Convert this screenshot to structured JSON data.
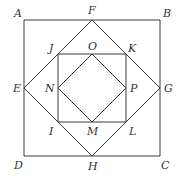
{
  "diagram": {
    "type": "nested-squares",
    "stroke_color": "#3a3a3a",
    "label_color": "#333333",
    "points": {
      "A": {
        "x": 24,
        "y": 20,
        "label": "A",
        "lx": 14,
        "ly": 17
      },
      "B": {
        "x": 160,
        "y": 20,
        "label": "B",
        "lx": 163,
        "ly": 17
      },
      "C": {
        "x": 160,
        "y": 156,
        "label": "C",
        "lx": 161,
        "ly": 169
      },
      "D": {
        "x": 24,
        "y": 156,
        "label": "D",
        "lx": 14,
        "ly": 169
      },
      "F": {
        "x": 92,
        "y": 20,
        "label": "F",
        "lx": 88,
        "ly": 14
      },
      "G": {
        "x": 160,
        "y": 88,
        "label": "G",
        "lx": 164,
        "ly": 92
      },
      "H": {
        "x": 92,
        "y": 156,
        "label": "H",
        "lx": 88,
        "ly": 170
      },
      "E": {
        "x": 24,
        "y": 88,
        "label": "E",
        "lx": 13,
        "ly": 92
      },
      "J": {
        "x": 58,
        "y": 54,
        "label": "J",
        "lx": 49,
        "ly": 52
      },
      "K": {
        "x": 126,
        "y": 54,
        "label": "K",
        "lx": 128,
        "ly": 52
      },
      "L": {
        "x": 126,
        "y": 122,
        "label": "L",
        "lx": 129,
        "ly": 135
      },
      "I": {
        "x": 58,
        "y": 122,
        "label": "I",
        "lx": 49,
        "ly": 135
      },
      "O": {
        "x": 92,
        "y": 54,
        "label": "O",
        "lx": 88,
        "ly": 50
      },
      "P": {
        "x": 126,
        "y": 88,
        "label": "P",
        "lx": 130,
        "ly": 92
      },
      "M": {
        "x": 92,
        "y": 122,
        "label": "M",
        "lx": 87,
        "ly": 135
      },
      "N": {
        "x": 58,
        "y": 88,
        "label": "N",
        "lx": 45,
        "ly": 92
      }
    },
    "shapes": [
      {
        "name": "outer-square-ABCD",
        "vertices": [
          "A",
          "B",
          "C",
          "D"
        ]
      },
      {
        "name": "diamond-FGHE",
        "vertices": [
          "F",
          "G",
          "H",
          "E"
        ]
      },
      {
        "name": "inner-square-JKLI",
        "vertices": [
          "J",
          "K",
          "L",
          "I"
        ]
      },
      {
        "name": "inner-diamond-OPMN",
        "vertices": [
          "O",
          "P",
          "M",
          "N"
        ]
      }
    ]
  }
}
